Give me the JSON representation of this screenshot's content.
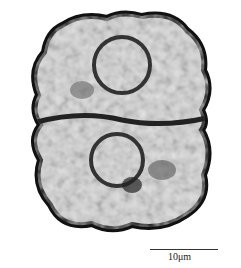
{
  "image": {
    "subject": "microscopy-specimen",
    "scale_bar": {
      "label": "10μm"
    }
  }
}
